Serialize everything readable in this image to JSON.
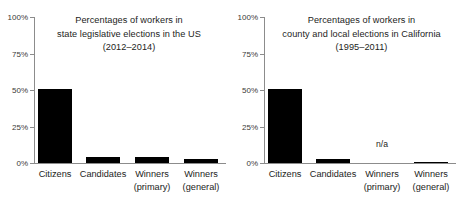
{
  "chart_data": [
    {
      "type": "bar",
      "panel": "left",
      "title": "Percentages of workers in state legislative elections in the US (2012–2014)",
      "title_lines": [
        "Percentages of workers in",
        "state legislative elections in the US",
        "(2012–2014)"
      ],
      "categories": [
        "Citizens",
        "Candidates",
        "Winners (primary)",
        "Winners (general)"
      ],
      "category_lines": [
        [
          "Citizens",
          ""
        ],
        [
          "Candidates",
          ""
        ],
        [
          "Winners",
          "(primary)"
        ],
        [
          "Winners",
          "(general)"
        ]
      ],
      "values": [
        51,
        4,
        4,
        3
      ],
      "value_labels": [
        "51%",
        "4%",
        "4%",
        "3%"
      ],
      "xlabel": "",
      "ylabel": "",
      "ylim": [
        0,
        100
      ],
      "yticks": [
        0,
        25,
        50,
        75,
        100
      ],
      "ytick_labels": [
        "0%",
        "25%",
        "50%",
        "75%",
        "100%"
      ],
      "grid": false,
      "legend": "none",
      "bar_color": "#000000"
    },
    {
      "type": "bar",
      "panel": "right",
      "title": "Percentages of workers in county and local elections in California (1995–2011)",
      "title_lines": [
        "Percentages of workers in",
        "county and local elections in California",
        "(1995–2011)"
      ],
      "categories": [
        "Citizens",
        "Candidates",
        "Winners (primary)",
        "Winners (general)"
      ],
      "category_lines": [
        [
          "Citizens",
          ""
        ],
        [
          "Candidates",
          ""
        ],
        [
          "Winners",
          "(primary)"
        ],
        [
          "Winners",
          "(general)"
        ]
      ],
      "values": [
        51,
        3,
        null,
        1
      ],
      "value_labels": [
        "51%",
        "3%",
        "n/a",
        "1%"
      ],
      "missing_label": "n/a",
      "xlabel": "",
      "ylabel": "",
      "ylim": [
        0,
        100
      ],
      "yticks": [
        0,
        25,
        50,
        75,
        100
      ],
      "ytick_labels": [
        "0%",
        "25%",
        "50%",
        "75%",
        "100%"
      ],
      "grid": false,
      "legend": "none",
      "bar_color": "#000000"
    }
  ],
  "figure": {
    "background": "#ffffff",
    "axis_color": "#8c8c8c",
    "text_color": "#1d1d1b"
  }
}
